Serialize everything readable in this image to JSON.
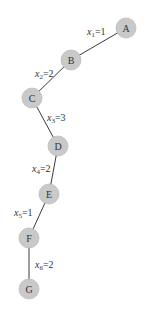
{
  "diagram": {
    "type": "path-tree",
    "node_color": "#c9c9c9",
    "edge_color": "#3a3a3a",
    "nodes": [
      {
        "id": "A",
        "label": "A",
        "cx": 126,
        "cy": 28
      },
      {
        "id": "B",
        "label": "B",
        "cx": 71,
        "cy": 60
      },
      {
        "id": "C",
        "label": "C",
        "cx": 32,
        "cy": 98
      },
      {
        "id": "D",
        "label": "D",
        "cx": 58,
        "cy": 146
      },
      {
        "id": "E",
        "label": "E",
        "cx": 49,
        "cy": 194
      },
      {
        "id": "F",
        "label": "F",
        "cx": 29,
        "cy": 238
      },
      {
        "id": "G",
        "label": "G",
        "cx": 29,
        "cy": 289
      }
    ],
    "edges": [
      {
        "from": "A",
        "to": "B",
        "var": "x",
        "sub": "1",
        "value": "=1",
        "lx": 87,
        "ly": 35
      },
      {
        "from": "B",
        "to": "C",
        "var": "x",
        "sub": "2",
        "value": "=2",
        "lx": 35,
        "ly": 77
      },
      {
        "from": "C",
        "to": "D",
        "var": "x",
        "sub": "3",
        "value": "=3",
        "lx": 47,
        "ly": 121
      },
      {
        "from": "D",
        "to": "E",
        "var": "x",
        "sub": "4",
        "value": "=2",
        "lx": 32,
        "ly": 172
      },
      {
        "from": "E",
        "to": "F",
        "var": "x",
        "sub": "5",
        "value": "=1",
        "lx": 14,
        "ly": 216
      },
      {
        "from": "F",
        "to": "G",
        "var": "x",
        "sub": "6",
        "value": "=2",
        "lx": 35,
        "ly": 268
      }
    ]
  }
}
